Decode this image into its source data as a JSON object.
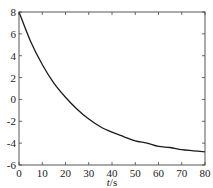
{
  "chart_data": {
    "type": "line",
    "title": "",
    "xlabel": "t/s",
    "ylabel": "",
    "xlim": [
      0,
      80
    ],
    "ylim": [
      -6,
      8
    ],
    "xticks": [
      0,
      10,
      20,
      30,
      40,
      50,
      60,
      70,
      80
    ],
    "yticks": [
      -6,
      -4,
      -2,
      0,
      2,
      4,
      6,
      8
    ],
    "grid": false,
    "legend": null,
    "series": [
      {
        "name": "curve",
        "color": "#1a1a1a",
        "x": [
          0,
          5,
          10,
          15,
          20,
          25,
          30,
          35,
          40,
          45,
          50,
          55,
          60,
          65,
          70,
          75,
          80
        ],
        "y": [
          8.0,
          5.3,
          3.2,
          1.5,
          0.2,
          -0.9,
          -1.8,
          -2.5,
          -3.0,
          -3.4,
          -3.8,
          -4.0,
          -4.3,
          -4.4,
          -4.6,
          -4.7,
          -4.8
        ]
      }
    ]
  }
}
